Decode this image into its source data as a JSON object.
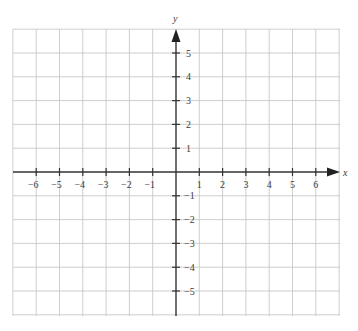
{
  "chart_data": {
    "type": "coordinate-grid",
    "title": "",
    "xlabel": "x",
    "ylabel": "y",
    "xlim": [
      -7,
      7
    ],
    "ylim": [
      -6,
      6
    ],
    "grid": true,
    "x_ticks": [
      -6,
      -5,
      -4,
      -3,
      -2,
      -1,
      1,
      2,
      3,
      4,
      5,
      6
    ],
    "y_ticks": [
      -5,
      -4,
      -3,
      -2,
      -1,
      1,
      2,
      3,
      4,
      5
    ],
    "x_tick_labels": [
      "−6",
      "−5",
      "−4",
      "−3",
      "−2",
      "−1",
      "1",
      "2",
      "3",
      "4",
      "5",
      "6"
    ],
    "y_tick_labels": [
      "−5",
      "−4",
      "−3",
      "−2",
      "−1",
      "1",
      "2",
      "3",
      "4",
      "5"
    ],
    "series": []
  },
  "axes": {
    "x_label": "x",
    "y_label": "y",
    "x_arrow_icon": "arrow-right-icon",
    "y_arrow_icon": "arrow-up-icon"
  },
  "colors": {
    "grid": "#c8c8c8",
    "axis": "#333333",
    "text": "#3a3a3a",
    "background": "#ffffff"
  }
}
